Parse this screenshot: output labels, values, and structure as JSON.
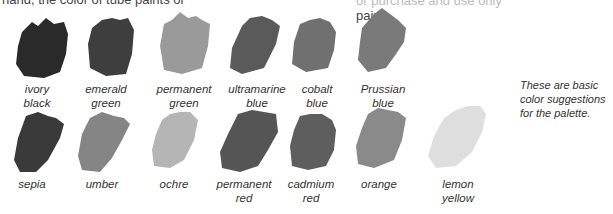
{
  "header": {
    "left_fragment": "hand, the color of tube paints or",
    "right_fragment_line1": "or purchase and use only",
    "right_fragment_line2": "paint."
  },
  "note": {
    "line1": "These are basic",
    "line2": "color suggestions",
    "line3": "for the palette."
  },
  "swatches_row1": [
    {
      "label1": "ivory",
      "label2": "black",
      "color": "#2a2a2a"
    },
    {
      "label1": "emerald",
      "label2": "green",
      "color": "#3e3e3e"
    },
    {
      "label1": "permanent",
      "label2": "green",
      "color": "#9a9a9a"
    },
    {
      "label1": "ultramarine",
      "label2": "blue",
      "color": "#5a5a5a"
    },
    {
      "label1": "cobalt",
      "label2": "blue",
      "color": "#707070"
    },
    {
      "label1": "Prussian",
      "label2": "blue",
      "color": "#7a7a7a"
    }
  ],
  "swatches_row2": [
    {
      "label1": "sepia",
      "label2": "",
      "color": "#3a3a3a"
    },
    {
      "label1": "umber",
      "label2": "",
      "color": "#858585"
    },
    {
      "label1": "ochre",
      "label2": "",
      "color": "#b5b5b5"
    },
    {
      "label1": "permanent",
      "label2": "red",
      "color": "#555555"
    },
    {
      "label1": "cadmium",
      "label2": "red",
      "color": "#5e5e5e"
    },
    {
      "label1": "orange",
      "label2": "",
      "color": "#8a8a8a"
    },
    {
      "label1": "lemon",
      "label2": "yellow",
      "color": "#dedede"
    }
  ]
}
